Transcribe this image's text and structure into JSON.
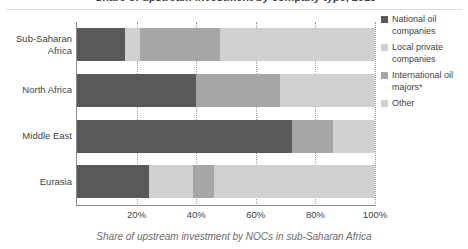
{
  "title": {
    "text": "Share of upstream investment by company type, 2015"
  },
  "caption": {
    "text": "Share of upstream investment by NOCs in sub-Saharan Africa"
  },
  "colors": {
    "national_oil_companies": "#595959",
    "local_private_companies": "#d0d0d0",
    "international_oil_majors": "#a6a6a6",
    "other": "#d0d0d0",
    "axis": "#8c8c8c",
    "gridline": "#9a9a9a",
    "text": "#3f3f3f",
    "caption_text": "#6b6b6b"
  },
  "legend": {
    "position": "right",
    "items": [
      {
        "label": "National oil companies",
        "color": "#595959"
      },
      {
        "label": "Local private companies",
        "color": "#d0d0d0"
      },
      {
        "label": "International oil majors*",
        "color": "#a6a6a6"
      },
      {
        "label": "Other",
        "color": "#d0d0d0"
      }
    ]
  },
  "xaxis": {
    "ticks": [
      {
        "label": "20%",
        "value": 20
      },
      {
        "label": "40%",
        "value": 40
      },
      {
        "label": "60%",
        "value": 60
      },
      {
        "label": "80%",
        "value": 80
      },
      {
        "label": "100%",
        "value": 100
      }
    ],
    "min": 0,
    "max": 100
  },
  "chart_data": {
    "type": "bar",
    "orientation": "horizontal",
    "stacked": true,
    "title": "Share of upstream investment by company type, 2015",
    "xlabel": "",
    "ylabel": "",
    "xlim": [
      0,
      100
    ],
    "grid": true,
    "legend_position": "right",
    "categories": [
      "Sub-Saharan Africa",
      "North Africa",
      "Middle East",
      "Eurasia"
    ],
    "series": [
      {
        "name": "National oil companies",
        "color": "#595959",
        "values": [
          16,
          40,
          72,
          24
        ]
      },
      {
        "name": "Local private companies",
        "color": "#d0d0d0",
        "values": [
          5,
          0,
          0,
          15
        ]
      },
      {
        "name": "International oil majors*",
        "color": "#a6a6a6",
        "values": [
          27,
          28,
          14,
          7
        ]
      },
      {
        "name": "Other",
        "color": "#d0d0d0",
        "values": [
          52,
          32,
          14,
          54
        ]
      }
    ]
  },
  "bars": [
    {
      "category": "Sub-Saharan Africa",
      "label_lines": [
        "Sub-Saharan",
        "Africa"
      ],
      "segments": [
        {
          "name": "National oil companies",
          "start": 0,
          "end": 16,
          "color": "#595959"
        },
        {
          "name": "Local private companies",
          "start": 16,
          "end": 21,
          "color": "#d0d0d0"
        },
        {
          "name": "International oil majors*",
          "start": 21,
          "end": 48,
          "color": "#a6a6a6"
        },
        {
          "name": "Other",
          "start": 48,
          "end": 100,
          "color": "#d0d0d0"
        }
      ]
    },
    {
      "category": "North Africa",
      "label_lines": [
        "North Africa"
      ],
      "segments": [
        {
          "name": "National oil companies",
          "start": 0,
          "end": 40,
          "color": "#595959"
        },
        {
          "name": "International oil majors*",
          "start": 40,
          "end": 68,
          "color": "#a6a6a6"
        },
        {
          "name": "Other",
          "start": 68,
          "end": 100,
          "color": "#d0d0d0"
        }
      ]
    },
    {
      "category": "Middle East",
      "label_lines": [
        "Middle East"
      ],
      "segments": [
        {
          "name": "National oil companies",
          "start": 0,
          "end": 72,
          "color": "#595959"
        },
        {
          "name": "International oil majors*",
          "start": 72,
          "end": 86,
          "color": "#a6a6a6"
        },
        {
          "name": "Other",
          "start": 86,
          "end": 100,
          "color": "#d0d0d0"
        }
      ]
    },
    {
      "category": "Eurasia",
      "label_lines": [
        "Eurasia"
      ],
      "segments": [
        {
          "name": "National oil companies",
          "start": 0,
          "end": 24,
          "color": "#595959"
        },
        {
          "name": "Local private companies",
          "start": 24,
          "end": 39,
          "color": "#d0d0d0"
        },
        {
          "name": "International oil majors*",
          "start": 39,
          "end": 46,
          "color": "#a6a6a6"
        },
        {
          "name": "Other",
          "start": 46,
          "end": 100,
          "color": "#d0d0d0"
        }
      ]
    }
  ]
}
